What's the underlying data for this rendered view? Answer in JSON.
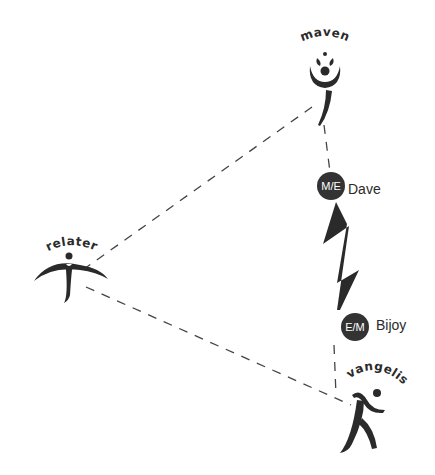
{
  "diagram": {
    "type": "relationship-triangle",
    "nodes": [
      {
        "id": "maven",
        "label": "maven",
        "icon": "maven-figure-icon"
      },
      {
        "id": "relater",
        "label": "relater",
        "icon": "relater-figure-icon"
      },
      {
        "id": "evangelist",
        "label": "evangelist",
        "icon": "evangelist-runner-icon"
      }
    ],
    "edges": [
      {
        "from": "maven",
        "to": "relater",
        "style": "dashed"
      },
      {
        "from": "relater",
        "to": "evangelist",
        "style": "dashed"
      },
      {
        "from": "maven",
        "to": "evangelist",
        "style": "dashed",
        "via": [
          "Dave",
          "Bijoy"
        ]
      }
    ],
    "people": [
      {
        "name": "Dave",
        "badge": "M/E"
      },
      {
        "name": "Bijoy",
        "badge": "E/M"
      }
    ],
    "conflict_symbol": "lightning-bolt-icon",
    "colors": {
      "ink": "#2a2a2a",
      "badge_fill": "#333333",
      "line": "#444444",
      "background": "#ffffff"
    }
  }
}
